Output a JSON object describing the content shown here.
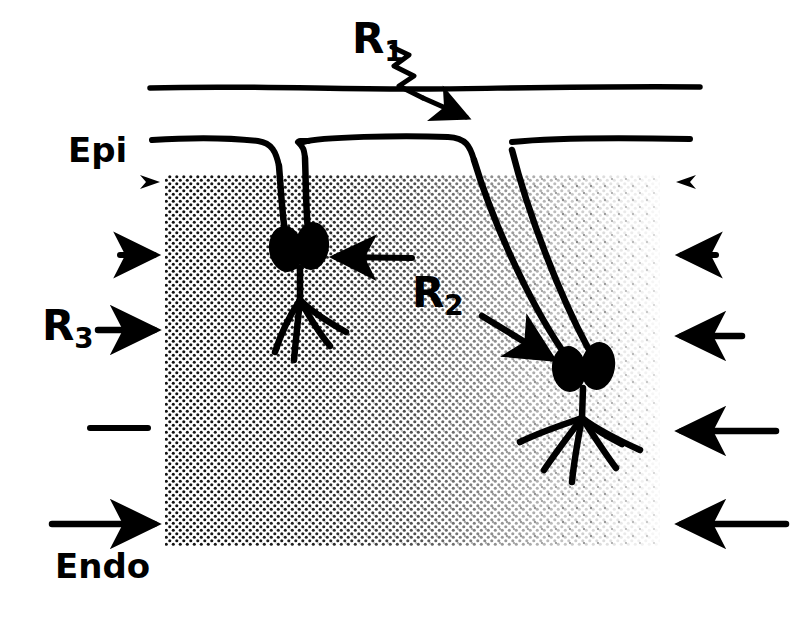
{
  "figure": {
    "kind": "myocardial-wall-schematic",
    "background_color": "#ffffff",
    "ink_color": "#000000",
    "width": 804,
    "height": 629
  },
  "labels": {
    "r1": {
      "base": "R",
      "sub": "1",
      "name": "region-1-label"
    },
    "r2": {
      "base": "R",
      "sub": "2",
      "name": "region-2-label"
    },
    "r3": {
      "base": "R",
      "sub": "3",
      "name": "region-3-label"
    },
    "epi": {
      "text": "Epi",
      "name": "epicardium-label"
    },
    "endo": {
      "text": "Endo",
      "name": "endocardium-label"
    }
  },
  "markers": {
    "left_column": [
      {
        "type": "arrowhead",
        "length": 0,
        "y": 182,
        "tip_x": 160
      },
      {
        "type": "arrow",
        "length": 40,
        "y": 255,
        "tip_x": 160
      },
      {
        "type": "arrow",
        "length": 62,
        "y": 330,
        "tip_x": 160
      },
      {
        "type": "line",
        "length": 58,
        "y": 428,
        "tip_x": 148
      },
      {
        "type": "arrow",
        "length": 110,
        "y": 524,
        "tip_x": 160
      }
    ],
    "right_column": [
      {
        "type": "arrowhead",
        "length": 0,
        "y": 182,
        "tip_x": 676
      },
      {
        "type": "arrow",
        "length": 40,
        "y": 255,
        "tip_x": 676
      },
      {
        "type": "arrow",
        "length": 66,
        "y": 336,
        "tip_x": 676
      },
      {
        "type": "arrow",
        "length": 100,
        "y": 431,
        "tip_x": 676
      },
      {
        "type": "arrow",
        "length": 110,
        "y": 524,
        "tip_x": 676
      }
    ],
    "r1_pointer": {
      "style": "zigzag-arrow",
      "from": [
        392,
        48
      ],
      "to": [
        468,
        118
      ]
    },
    "r2_pointer": {
      "style": "straight-arrow",
      "from": [
        484,
        318
      ],
      "to": [
        556,
        362
      ]
    },
    "cell1_pointer": {
      "style": "straight-arrow",
      "from": [
        412,
        258
      ],
      "to": [
        332,
        257
      ]
    }
  },
  "anatomy": {
    "top_boundary_label": "outer-surface-line",
    "epicardial_line_label": "epicardial-surface-line",
    "shaded_region_label": "myocardial-wall-shading",
    "shading_note": "halftone dot density fades from dense at left to sparse at right",
    "shading_bounds": {
      "left": 165,
      "top": 175,
      "right": 660,
      "bottom": 546
    }
  },
  "cells": [
    {
      "name": "purkinje-cell-left",
      "soma_center": [
        296,
        248
      ],
      "soma_count": 2,
      "dendrite_count": 4
    },
    {
      "name": "purkinje-cell-right",
      "soma_center": [
        580,
        370
      ],
      "soma_count": 2,
      "dendrite_count": 6
    }
  ]
}
